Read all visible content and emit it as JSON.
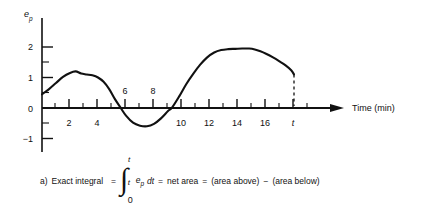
{
  "figure": {
    "y_axis_label": "e",
    "y_axis_sub": "p",
    "x_axis_label": "Time (min)",
    "end_marker_label": "t"
  },
  "caption": {
    "prefix": "a)",
    "lead": "Exact integral",
    "eq1": "=",
    "integral_sign": "∫",
    "limit_upper": "t",
    "limit_lower": "0",
    "ghost_upper": "t",
    "integrand_base": "e",
    "integrand_sub": "p",
    "differential": "dt",
    "eq2": "=",
    "net_area": "net area",
    "eq3": "=",
    "term_above": "(area above)",
    "minus": "−",
    "term_below": "(area below)"
  },
  "chart_data": {
    "type": "line",
    "title": "",
    "xlabel": "Time (min)",
    "ylabel": "e_p",
    "xlim": [
      0,
      19.2
    ],
    "ylim": [
      -1.6,
      2.6
    ],
    "grid": false,
    "legend": null,
    "x_major_ticks": [
      2,
      4,
      6,
      8,
      10,
      12,
      14,
      16
    ],
    "x_major_tick_labels": [
      "2",
      "4",
      "6",
      "8",
      "10",
      "12",
      "14",
      "16"
    ],
    "x_labels_above_axis": [
      "6",
      "8"
    ],
    "x_labels_below_axis": [
      "2",
      "4",
      "10",
      "12",
      "14",
      "16"
    ],
    "x_minor_ticks": [
      1,
      3,
      5,
      7,
      9,
      11,
      13,
      15,
      17
    ],
    "y_major_ticks": [
      -1,
      0,
      1,
      2
    ],
    "y_major_tick_labels": [
      "−1",
      "0",
      "1",
      "2"
    ],
    "y_minor_ticks": [
      -0.5,
      0.5,
      1.5
    ],
    "end_marker_x": 18,
    "end_marker_label": "t",
    "end_marker_style": "dashed-vertical",
    "series": [
      {
        "name": "e_p",
        "x": [
          0,
          0.5,
          1.0,
          1.5,
          2.0,
          2.4,
          2.8,
          3.2,
          3.6,
          4.0,
          4.4,
          4.8,
          5.2,
          5.6,
          6.0,
          6.5,
          7.0,
          7.5,
          8.0,
          8.5,
          9.0,
          9.3,
          9.8,
          10.3,
          10.8,
          11.3,
          11.8,
          12.3,
          12.8,
          13.3,
          13.8,
          14.3,
          14.8,
          15.2,
          15.6,
          16.0,
          16.5,
          17.0,
          17.4,
          17.8,
          18.0
        ],
        "y": [
          0.45,
          0.62,
          0.82,
          1.02,
          1.15,
          1.2,
          1.13,
          1.1,
          1.07,
          1.0,
          0.86,
          0.62,
          0.3,
          0.02,
          -0.25,
          -0.48,
          -0.58,
          -0.6,
          -0.52,
          -0.34,
          -0.1,
          0.02,
          0.38,
          0.78,
          1.12,
          1.42,
          1.66,
          1.82,
          1.9,
          1.93,
          1.94,
          1.95,
          1.95,
          1.92,
          1.86,
          1.78,
          1.66,
          1.52,
          1.4,
          1.24,
          1.1
        ]
      }
    ]
  }
}
